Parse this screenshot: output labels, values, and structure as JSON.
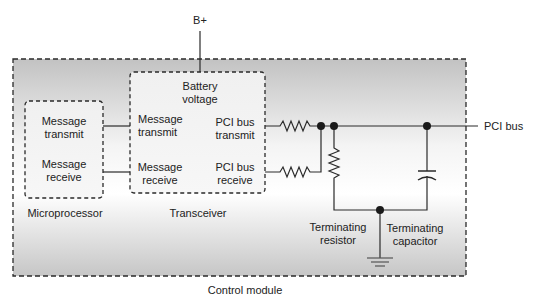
{
  "diagram": {
    "supply_label": "B+",
    "bus_label": "PCI bus",
    "module_label": "Control module",
    "microprocessor": {
      "label": "Microprocessor",
      "transmit_label": [
        "Message",
        "transmit"
      ],
      "receive_label": [
        "Message",
        "receive"
      ]
    },
    "transceiver": {
      "label": "Transceiver",
      "battery_label": [
        "Battery",
        "voltage"
      ],
      "msg_transmit_label": [
        "Message",
        "transmit"
      ],
      "msg_receive_label": [
        "Message",
        "receive"
      ],
      "bus_transmit_label": [
        "PCI bus",
        "transmit"
      ],
      "bus_receive_label": [
        "PCI bus",
        "receive"
      ]
    },
    "terminating_resistor_label": [
      "Terminating",
      "resistor"
    ],
    "terminating_capacitor_label": [
      "Terminating",
      "capacitor"
    ],
    "colors": {
      "line": "#2a2a2a",
      "module_top": "#c4c4c4",
      "module_mid": "#fbfbfb",
      "module_bottom": "#c8c8c8",
      "inner_box": "#f2f2f2"
    }
  }
}
